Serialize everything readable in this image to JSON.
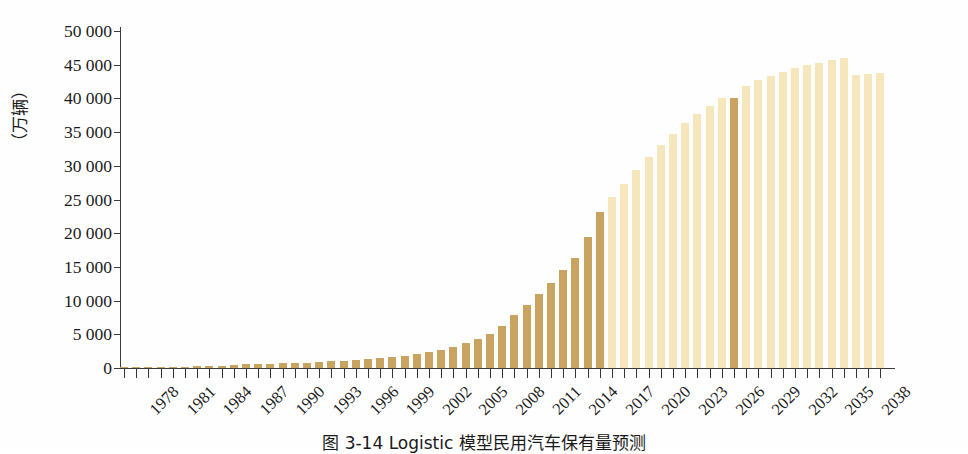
{
  "figure": {
    "caption": "图 3-14  Logistic 模型民用汽车保有量预测",
    "y_axis_title": "（万辆）"
  },
  "chart_data": {
    "type": "bar",
    "title": "图 3-14  Logistic 模型民用汽车保有量预测",
    "xlabel": "",
    "ylabel": "（万辆）",
    "ylim": [
      0,
      50000
    ],
    "ytick_values": [
      0,
      5000,
      10000,
      15000,
      20000,
      25000,
      30000,
      35000,
      40000,
      45000,
      50000
    ],
    "ytick_labels": [
      "0",
      "5 000",
      "10 000",
      "15 000",
      "20 000",
      "25 000",
      "30 000",
      "35 000",
      "40 000",
      "45 000",
      "50 000"
    ],
    "grid": false,
    "legend": null,
    "xtick_labels": [
      "1978",
      "1981",
      "1984",
      "1987",
      "1990",
      "1993",
      "1996",
      "1999",
      "2002",
      "2005",
      "2008",
      "2011",
      "2014",
      "2017",
      "2020",
      "2023",
      "2026",
      "2029",
      "2032",
      "2035",
      "2038"
    ],
    "xtick_step_years": 3,
    "colors": {
      "historical_bar": "#c9a460",
      "forecast_bar": "#f5e6bc",
      "highlight_bar": "#c9a460",
      "axis": "#3a3a3a",
      "text": "#1a1a1a",
      "background": "#fefefe"
    },
    "series": [
      {
        "name": "民用汽车保有量",
        "categories": [
          1978,
          1979,
          1980,
          1981,
          1982,
          1983,
          1984,
          1985,
          1986,
          1987,
          1988,
          1989,
          1990,
          1991,
          1992,
          1993,
          1994,
          1995,
          1996,
          1997,
          1998,
          1999,
          2000,
          2001,
          2002,
          2003,
          2004,
          2005,
          2006,
          2007,
          2008,
          2009,
          2010,
          2011,
          2012,
          2013,
          2014,
          2015,
          2016,
          2017,
          2018,
          2019,
          2020,
          2021,
          2022,
          2023,
          2024,
          2025,
          2026,
          2027,
          2028,
          2029,
          2030,
          2031,
          2032,
          2033,
          2034,
          2035,
          2036,
          2037,
          2038,
          2039,
          2040
        ],
        "values": [
          136,
          150,
          178,
          193,
          204,
          219,
          238,
          321,
          362,
          440,
          547,
          624,
          662,
          708,
          716,
          818,
          942,
          1040,
          1100,
          1219,
          1319,
          1453,
          1609,
          1802,
          2053,
          2383,
          2694,
          3160,
          3697,
          4358,
          5100,
          6209,
          7802,
          9356,
          10933,
          12670,
          14598,
          16284,
          19440,
          23094,
          25376,
          27341,
          29361,
          31295,
          33108,
          34782,
          36310,
          37692,
          38932,
          40039,
          40000,
          41886,
          42659,
          43337,
          43932,
          44453,
          44909,
          45306,
          45653,
          45955,
          43500,
          43600,
          43700
        ]
      }
    ],
    "historical_years": [
      1978,
      2017
    ],
    "forecast_years": [
      2018,
      2040
    ],
    "highlighted_year": 2028,
    "highlighted_value": 40000
  }
}
